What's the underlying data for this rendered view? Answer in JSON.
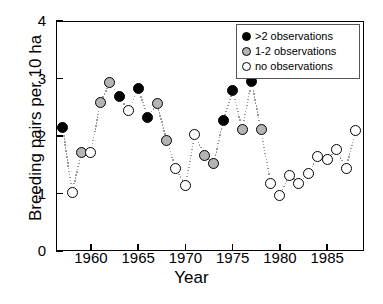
{
  "chart_data": {
    "type": "scatter",
    "title": "",
    "xlabel": "Year",
    "ylabel": "Breeding pairs per 10 ha",
    "xlim": [
      1956.3,
      1988.9
    ],
    "ylim": [
      0,
      4
    ],
    "grid": false,
    "xticks": [
      1960,
      1965,
      1970,
      1975,
      1980,
      1985
    ],
    "yticks": [
      0,
      1,
      2,
      3,
      4
    ],
    "legend_position": "top-right",
    "connector": "dotted-line",
    "series": [
      {
        "name": ">2 observations",
        "marker": "filled-circle",
        "color": "#000000"
      },
      {
        "name": "1-2 observations",
        "marker": "gray-circle",
        "color": "#b4b4b4"
      },
      {
        "name": "no observations",
        "marker": "open-circle",
        "color": "#ffffff"
      }
    ],
    "x": [
      1957,
      1958,
      1959,
      1960,
      1961,
      1962,
      1963,
      1964,
      1965,
      1966,
      1967,
      1968,
      1969,
      1970,
      1971,
      1972,
      1973,
      1974,
      1975,
      1976,
      1977,
      1978,
      1979,
      1980,
      1981,
      1982,
      1983,
      1984,
      1985,
      1986,
      1987,
      1988
    ],
    "values": [
      2.15,
      1.02,
      1.72,
      1.72,
      2.58,
      2.93,
      2.68,
      2.44,
      2.83,
      2.33,
      2.56,
      1.93,
      1.43,
      1.14,
      2.03,
      1.66,
      1.52,
      2.27,
      2.79,
      2.12,
      2.94,
      2.11,
      1.18,
      0.97,
      1.32,
      1.18,
      1.34,
      1.64,
      1.6,
      1.76,
      1.43,
      2.09
    ],
    "categories_per_point": [
      "filled",
      "open",
      "gray",
      "open",
      "gray",
      "gray",
      "filled",
      "open",
      "filled",
      "filled",
      "gray",
      "gray",
      "open",
      "open",
      "open",
      "gray",
      "gray",
      "filled",
      "filled",
      "gray",
      "filled",
      "gray",
      "open",
      "open",
      "open",
      "open",
      "open",
      "open",
      "open",
      "open",
      "open",
      "open"
    ]
  },
  "legend": {
    "items": [
      {
        "label": ">2 observations",
        "style": "filled"
      },
      {
        "label": "1-2 observations",
        "style": "gray"
      },
      {
        "label": "no observations",
        "style": "open"
      }
    ]
  },
  "axes": {
    "y_tick_labels": [
      "0",
      "1",
      "2",
      "3",
      "4"
    ],
    "x_tick_labels": [
      "1960",
      "1965",
      "1970",
      "1975",
      "1980",
      "1985"
    ],
    "x_title": "Year",
    "y_title": "Breeding pairs per 10 ha"
  }
}
